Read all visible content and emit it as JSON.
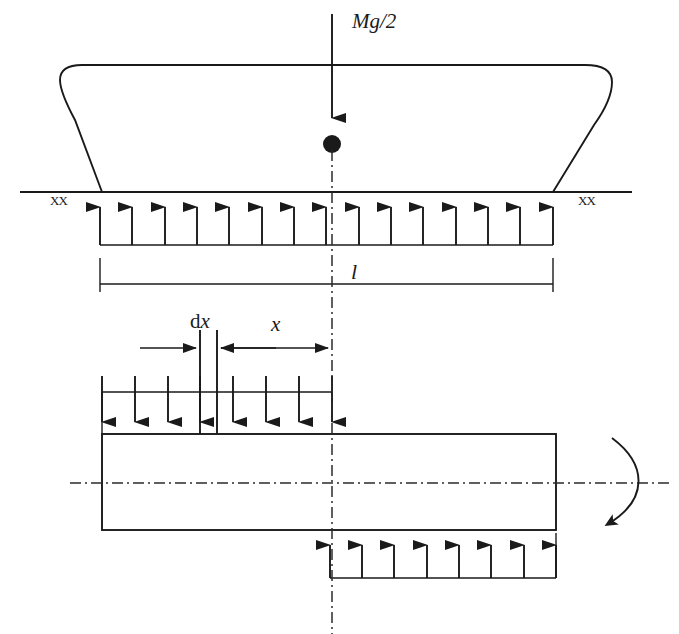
{
  "figure": {
    "colors": {
      "ink": "#1a1a1a",
      "centerline": "#2b2b2b",
      "background": "#ffffff"
    },
    "labels": {
      "load_force": "Mg/2",
      "span_length": "l",
      "element_width_prefix": "d",
      "element_width_var": "x",
      "distance": "x",
      "support_hatch_left": "XX",
      "support_hatch_right": "XX"
    },
    "upper_diagram": {
      "ground_line": {
        "x1": 20,
        "x2": 632,
        "y": 192
      },
      "body_outline": {
        "description": "rounded-top container with splayed legs resting on ground line",
        "left_foot_x": 102,
        "right_foot_x": 553,
        "top_y": 65,
        "corner_radius": 30
      },
      "applied_load": {
        "arrow_x": 332,
        "arrow_top_y": 14,
        "arrow_tip_y": 130,
        "node_dot_cx": 332,
        "node_dot_cy": 144,
        "node_dot_r": 9,
        "direction": "down",
        "count": 1
      },
      "reaction_arrows": {
        "direction": "up",
        "count": 15,
        "x_start": 100,
        "x_end": 553,
        "tip_y": 195,
        "tail_y": 245
      },
      "base_line": {
        "x1": 100,
        "x2": 553,
        "y": 245
      },
      "dimension": {
        "y": 284,
        "x1": 100,
        "x2": 553,
        "tick_top_y": 258,
        "tick_bottom_y": 292,
        "label_x": 351,
        "label_y": 279
      }
    },
    "lower_diagram": {
      "dimension_row": {
        "y": 348,
        "dx_left_x": 200,
        "dx_right_x": 217,
        "x_dim_left_x": 217,
        "x_dim_right_x": 332,
        "dx_feed_left_x": 140,
        "dx_label_x": 208,
        "dx_label_y": 328,
        "x_label_x": 276,
        "x_label_y": 330,
        "tick_top_y": 330,
        "tick_bottom_y": 434
      },
      "top_load": {
        "direction": "down",
        "count": 8,
        "x_start": 102,
        "x_end": 332,
        "tail_y": 392,
        "tip_y": 434,
        "rail_y": 392
      },
      "beam_rect": {
        "x": 102,
        "y": 434,
        "width": 454,
        "height": 96
      },
      "bottom_load": {
        "direction": "up",
        "count": 8,
        "x_start": 330,
        "x_end": 556,
        "tip_y": 533,
        "tail_y": 578,
        "rail_y": 578
      },
      "horizontal_centerline": {
        "x1": 70,
        "x2": 672,
        "y": 483
      },
      "vertical_centerline": {
        "x": 332,
        "y1": 150,
        "y2": 634
      },
      "rotation_arrow": {
        "direction": "clockwise",
        "start_x": 612,
        "start_y": 438,
        "end_x": 606,
        "end_y": 532,
        "bow_x": 648
      }
    }
  }
}
